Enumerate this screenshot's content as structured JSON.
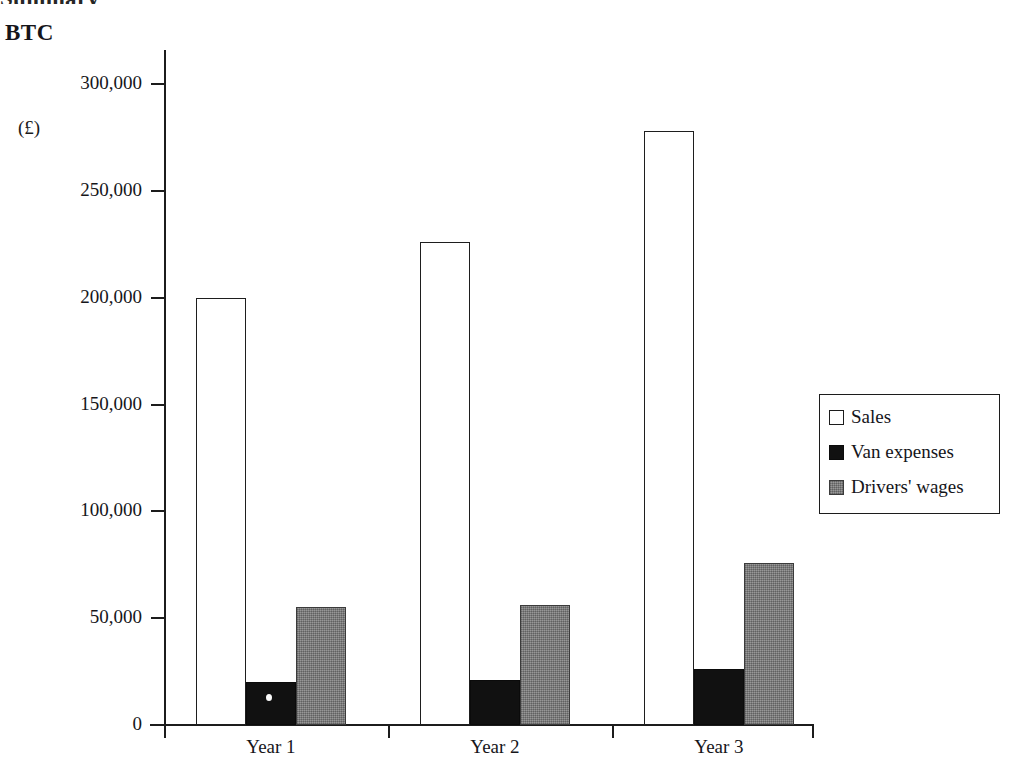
{
  "page": {
    "clipped_heading_above": "Summary",
    "title": "BTC",
    "currency_label": "(£)"
  },
  "legend": {
    "position": "right",
    "items": [
      {
        "label": "Sales",
        "swatch": "white-square-icon",
        "color": "#ffffff"
      },
      {
        "label": "Van expenses",
        "swatch": "black-square-icon",
        "color": "#111111"
      },
      {
        "label": "Drivers' wages",
        "swatch": "gray-square-icon",
        "color": "#7f7f7f"
      }
    ]
  },
  "chart_data": {
    "type": "bar",
    "title": "BTC",
    "xlabel": "",
    "ylabel": "(£)",
    "ylim": [
      0,
      300000
    ],
    "ytick_values": [
      0,
      50000,
      100000,
      150000,
      200000,
      250000,
      300000
    ],
    "ytick_labels": [
      "0",
      "50,000",
      "100,000",
      "150,000",
      "200,000",
      "250,000",
      "300,000"
    ],
    "grid": false,
    "legend_position": "right",
    "categories": [
      "Year 1",
      "Year 2",
      "Year 3"
    ],
    "series": [
      {
        "name": "Sales",
        "values": [
          200000,
          226000,
          278000
        ],
        "color": "#ffffff"
      },
      {
        "name": "Van expenses",
        "values": [
          20000,
          21000,
          26000
        ],
        "color": "#111111"
      },
      {
        "name": "Drivers' wages",
        "values": [
          55000,
          56000,
          76000
        ],
        "color": "#7f7f7f"
      }
    ]
  },
  "geometry": {
    "y_axis_x": 164,
    "baseline_y": 725,
    "px_per_unit": 0.0021367,
    "bar_width": 50,
    "group_starts": [
      196,
      420,
      644
    ],
    "x_tick_positions": [
      164,
      388,
      612,
      812
    ],
    "cat_label_centers": [
      271,
      495,
      719
    ]
  }
}
